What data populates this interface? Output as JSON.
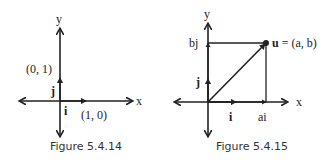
{
  "figures": [
    {
      "caption": "Figure 5.4.14",
      "labels": {
        "y": "y",
        "x": "x",
        "j": "j",
        "i": "i",
        "point_j": "(0, 1)",
        "point_i": "(1, 0)"
      }
    },
    {
      "caption": "Figure 5.4.15",
      "labels": {
        "y": "y",
        "x": "x",
        "j": "j",
        "i": "i",
        "bj": "bj",
        "ai": "ai",
        "u_bold": "u",
        "u_rest": " = (a, b)"
      }
    }
  ],
  "colors": {
    "stroke": "#222222"
  }
}
